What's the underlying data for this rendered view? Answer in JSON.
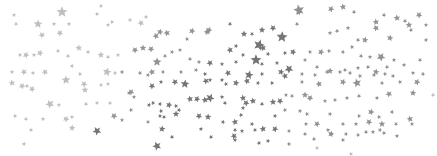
{
  "image": {
    "description": "Scattered gray star confetti on white background",
    "background": "#ffffff",
    "colors": {
      "dark": "#6e6e6e",
      "mid": "#8c8c8c",
      "light": "#b4b4b4"
    },
    "stars": [
      [
        62,
        12,
        5,
        "light"
      ],
      [
        101,
        6,
        2,
        "light"
      ],
      [
        14,
        15,
        2,
        "light"
      ],
      [
        16,
        24,
        2,
        "light"
      ],
      [
        38,
        24,
        4,
        "light"
      ],
      [
        42,
        35,
        3,
        "light"
      ],
      [
        54,
        24,
        2,
        "light"
      ],
      [
        60,
        33,
        3,
        "light"
      ],
      [
        69,
        24,
        2,
        "light"
      ],
      [
        97,
        14,
        2,
        "light"
      ],
      [
        108,
        25,
        2,
        "light"
      ],
      [
        112,
        22,
        2,
        "light"
      ],
      [
        130,
        20,
        2,
        "light"
      ],
      [
        141,
        23,
        3,
        "light"
      ],
      [
        146,
        17,
        2,
        "light"
      ],
      [
        156,
        36,
        3,
        "mid"
      ],
      [
        160,
        32,
        3,
        "mid"
      ],
      [
        167,
        33,
        3,
        "mid"
      ],
      [
        172,
        52,
        2,
        "mid"
      ],
      [
        187,
        39,
        2,
        "mid"
      ],
      [
        192,
        31,
        3,
        "mid"
      ],
      [
        207,
        32,
        3,
        "mid"
      ],
      [
        209,
        30,
        3,
        "mid"
      ],
      [
        20,
        55,
        2,
        "light"
      ],
      [
        26,
        55,
        3,
        "light"
      ],
      [
        34,
        55,
        2,
        "light"
      ],
      [
        40,
        53,
        3,
        "light"
      ],
      [
        58,
        51,
        2,
        "light"
      ],
      [
        68,
        56,
        2,
        "light"
      ],
      [
        79,
        48,
        3,
        "light"
      ],
      [
        88,
        52,
        2,
        "light"
      ],
      [
        101,
        55,
        3,
        "light"
      ],
      [
        108,
        57,
        2,
        "light"
      ],
      [
        118,
        55,
        2,
        "light"
      ],
      [
        135,
        50,
        3,
        "mid"
      ],
      [
        143,
        48,
        3,
        "mid"
      ],
      [
        151,
        49,
        3,
        "mid"
      ],
      [
        157,
        62,
        4,
        "mid"
      ],
      [
        165,
        56,
        2,
        "mid"
      ],
      [
        180,
        50,
        2,
        "mid"
      ],
      [
        190,
        59,
        2,
        "mid"
      ],
      [
        199,
        62,
        2,
        "mid"
      ],
      [
        210,
        63,
        3,
        "dark"
      ],
      [
        12,
        72,
        2,
        "light"
      ],
      [
        24,
        72,
        3,
        "light"
      ],
      [
        33,
        73,
        2,
        "light"
      ],
      [
        45,
        72,
        3,
        "light"
      ],
      [
        72,
        66,
        2,
        "light"
      ],
      [
        80,
        74,
        2,
        "light"
      ],
      [
        107,
        72,
        4,
        "light"
      ],
      [
        115,
        73,
        2,
        "light"
      ],
      [
        122,
        72,
        2,
        "mid"
      ],
      [
        140,
        73,
        2,
        "mid"
      ],
      [
        148,
        75,
        2,
        "mid"
      ],
      [
        152,
        72,
        3,
        "mid"
      ],
      [
        163,
        72,
        2,
        "mid"
      ],
      [
        181,
        72,
        2,
        "mid"
      ],
      [
        196,
        70,
        2,
        "mid"
      ],
      [
        205,
        74,
        2,
        "dark"
      ],
      [
        299,
        12,
        3,
        "mid"
      ],
      [
        299,
        10,
        5,
        "mid"
      ],
      [
        331,
        9,
        3,
        "mid"
      ],
      [
        343,
        7,
        3,
        "mid"
      ],
      [
        354,
        12,
        2,
        "mid"
      ],
      [
        376,
        22,
        3,
        "mid"
      ],
      [
        384,
        15,
        2,
        "mid"
      ],
      [
        397,
        18,
        3,
        "mid"
      ],
      [
        405,
        21,
        2,
        "mid"
      ],
      [
        409,
        25,
        3,
        "mid"
      ],
      [
        419,
        15,
        3,
        "mid"
      ],
      [
        426,
        25,
        2,
        "mid"
      ],
      [
        230,
        24,
        2,
        "dark"
      ],
      [
        244,
        34,
        3,
        "dark"
      ],
      [
        252,
        34,
        2,
        "dark"
      ],
      [
        262,
        30,
        3,
        "dark"
      ],
      [
        273,
        28,
        3,
        "dark"
      ],
      [
        282,
        37,
        5,
        "dark"
      ],
      [
        297,
        24,
        2,
        "mid"
      ],
      [
        330,
        33,
        2,
        "mid"
      ],
      [
        337,
        31,
        2,
        "mid"
      ],
      [
        348,
        28,
        2,
        "mid"
      ],
      [
        358,
        40,
        2,
        "mid"
      ],
      [
        365,
        40,
        3,
        "mid"
      ],
      [
        376,
        28,
        3,
        "mid"
      ],
      [
        390,
        38,
        3,
        "mid"
      ],
      [
        411,
        30,
        2,
        "mid"
      ],
      [
        426,
        40,
        2,
        "mid"
      ],
      [
        230,
        50,
        3,
        "dark"
      ],
      [
        236,
        46,
        2,
        "dark"
      ],
      [
        243,
        55,
        2,
        "dark"
      ],
      [
        259,
        45,
        5,
        "dark"
      ],
      [
        263,
        48,
        3,
        "dark"
      ],
      [
        268,
        54,
        2,
        "dark"
      ],
      [
        285,
        53,
        2,
        "dark"
      ],
      [
        293,
        52,
        3,
        "dark"
      ],
      [
        310,
        52,
        2,
        "mid"
      ],
      [
        321,
        52,
        3,
        "mid"
      ],
      [
        329,
        51,
        2,
        "mid"
      ],
      [
        343,
        52,
        2,
        "mid"
      ],
      [
        352,
        47,
        2,
        "mid"
      ],
      [
        361,
        56,
        2,
        "mid"
      ],
      [
        370,
        57,
        2,
        "mid"
      ],
      [
        381,
        57,
        4,
        "mid"
      ],
      [
        394,
        60,
        2,
        "mid"
      ],
      [
        420,
        60,
        2,
        "mid"
      ],
      [
        222,
        64,
        2,
        "dark"
      ],
      [
        236,
        62,
        2,
        "dark"
      ],
      [
        256,
        60,
        5,
        "dark"
      ],
      [
        262,
        64,
        2,
        "dark"
      ],
      [
        277,
        63,
        2,
        "dark"
      ],
      [
        289,
        69,
        4,
        "dark"
      ],
      [
        305,
        60,
        2,
        "mid"
      ],
      [
        317,
        67,
        2,
        "mid"
      ],
      [
        330,
        71,
        3,
        "mid"
      ],
      [
        345,
        70,
        2,
        "mid"
      ],
      [
        358,
        68,
        2,
        "mid"
      ],
      [
        368,
        67,
        2,
        "mid"
      ],
      [
        376,
        72,
        3,
        "mid"
      ],
      [
        387,
        67,
        2,
        "mid"
      ],
      [
        404,
        65,
        2,
        "mid"
      ],
      [
        228,
        73,
        3,
        "dark"
      ],
      [
        249,
        75,
        4,
        "dark"
      ],
      [
        262,
        74,
        2,
        "dark"
      ],
      [
        281,
        72,
        3,
        "dark"
      ],
      [
        285,
        76,
        3,
        "dark"
      ],
      [
        302,
        74,
        2,
        "mid"
      ],
      [
        315,
        75,
        2,
        "mid"
      ],
      [
        327,
        72,
        2,
        "mid"
      ],
      [
        340,
        72,
        2,
        "mid"
      ],
      [
        350,
        73,
        2,
        "mid"
      ],
      [
        360,
        76,
        2,
        "mid"
      ],
      [
        374,
        75,
        2,
        "mid"
      ],
      [
        385,
        74,
        2,
        "mid"
      ],
      [
        393,
        76,
        2,
        "mid"
      ],
      [
        413,
        73,
        2,
        "mid"
      ],
      [
        423,
        74,
        2,
        "mid"
      ],
      [
        12,
        83,
        3,
        "light"
      ],
      [
        22,
        86,
        3,
        "light"
      ],
      [
        27,
        86,
        2,
        "light"
      ],
      [
        32,
        89,
        3,
        "light"
      ],
      [
        66,
        80,
        4,
        "light"
      ],
      [
        84,
        84,
        3,
        "light"
      ],
      [
        85,
        90,
        3,
        "light"
      ],
      [
        101,
        85,
        2,
        "light"
      ],
      [
        108,
        84,
        2,
        "light"
      ],
      [
        131,
        92,
        3,
        "mid"
      ],
      [
        134,
        97,
        2,
        "mid"
      ],
      [
        152,
        86,
        3,
        "dark"
      ],
      [
        161,
        82,
        2,
        "dark"
      ],
      [
        175,
        82,
        3,
        "dark"
      ],
      [
        185,
        84,
        4,
        "dark"
      ],
      [
        206,
        81,
        3,
        "dark"
      ],
      [
        210,
        80,
        2,
        "dark"
      ],
      [
        50,
        104,
        4,
        "light"
      ],
      [
        59,
        105,
        2,
        "light"
      ],
      [
        86,
        104,
        2,
        "light"
      ],
      [
        97,
        103,
        2,
        "light"
      ],
      [
        110,
        103,
        2,
        "light"
      ],
      [
        129,
        93,
        2,
        "mid"
      ],
      [
        131,
        110,
        2,
        "mid"
      ],
      [
        149,
        105,
        2,
        "dark"
      ],
      [
        153,
        103,
        2,
        "dark"
      ],
      [
        160,
        104,
        2,
        "dark"
      ],
      [
        161,
        111,
        2,
        "dark"
      ],
      [
        169,
        105,
        3,
        "dark"
      ],
      [
        176,
        106,
        2,
        "dark"
      ],
      [
        179,
        110,
        2,
        "dark"
      ],
      [
        190,
        99,
        3,
        "dark"
      ],
      [
        197,
        99,
        3,
        "dark"
      ],
      [
        205,
        100,
        3,
        "dark"
      ],
      [
        210,
        98,
        4,
        "dark"
      ],
      [
        15,
        116,
        2,
        "light"
      ],
      [
        26,
        119,
        2,
        "light"
      ],
      [
        43,
        119,
        2,
        "light"
      ],
      [
        66,
        119,
        3,
        "light"
      ],
      [
        72,
        117,
        2,
        "light"
      ],
      [
        114,
        116,
        3,
        "mid"
      ],
      [
        122,
        120,
        2,
        "mid"
      ],
      [
        148,
        122,
        2,
        "mid"
      ],
      [
        160,
        116,
        2,
        "dark"
      ],
      [
        164,
        117,
        2,
        "dark"
      ],
      [
        176,
        114,
        3,
        "dark"
      ],
      [
        199,
        116,
        3,
        "dark"
      ],
      [
        208,
        117,
        3,
        "dark"
      ],
      [
        31,
        130,
        2,
        "light"
      ],
      [
        72,
        128,
        3,
        "light"
      ],
      [
        97,
        131,
        4,
        "dark"
      ],
      [
        162,
        129,
        3,
        "dark"
      ],
      [
        172,
        137,
        2,
        "dark"
      ],
      [
        201,
        129,
        2,
        "dark"
      ],
      [
        211,
        137,
        2,
        "dark"
      ],
      [
        24,
        144,
        2,
        "light"
      ],
      [
        157,
        146,
        4,
        "dark"
      ],
      [
        222,
        80,
        2,
        "dark"
      ],
      [
        226,
        84,
        2,
        "dark"
      ],
      [
        236,
        83,
        3,
        "dark"
      ],
      [
        247,
        81,
        3,
        "dark"
      ],
      [
        258,
        83,
        2,
        "dark"
      ],
      [
        272,
        83,
        2,
        "dark"
      ],
      [
        302,
        82,
        2,
        "mid"
      ],
      [
        319,
        84,
        3,
        "mid"
      ],
      [
        343,
        82,
        3,
        "mid"
      ],
      [
        357,
        83,
        4,
        "mid"
      ],
      [
        382,
        83,
        2,
        "mid"
      ],
      [
        400,
        82,
        2,
        "mid"
      ],
      [
        417,
        82,
        3,
        "mid"
      ],
      [
        222,
        97,
        2,
        "dark"
      ],
      [
        225,
        103,
        2,
        "dark"
      ],
      [
        243,
        98,
        3,
        "dark"
      ],
      [
        246,
        103,
        3,
        "dark"
      ],
      [
        253,
        101,
        3,
        "dark"
      ],
      [
        262,
        104,
        2,
        "dark"
      ],
      [
        273,
        102,
        3,
        "dark"
      ],
      [
        280,
        101,
        3,
        "dark"
      ],
      [
        286,
        95,
        2,
        "mid"
      ],
      [
        292,
        96,
        2,
        "mid"
      ],
      [
        305,
        95,
        3,
        "mid"
      ],
      [
        310,
        98,
        3,
        "mid"
      ],
      [
        325,
        101,
        2,
        "mid"
      ],
      [
        335,
        100,
        2,
        "mid"
      ],
      [
        347,
        98,
        2,
        "mid"
      ],
      [
        359,
        96,
        2,
        "mid"
      ],
      [
        377,
        98,
        2,
        "mid"
      ],
      [
        389,
        94,
        3,
        "mid"
      ],
      [
        413,
        93,
        3,
        "mid"
      ],
      [
        433,
        95,
        2,
        "light"
      ],
      [
        243,
        108,
        2,
        "dark"
      ],
      [
        241,
        115,
        2,
        "dark"
      ],
      [
        275,
        116,
        2,
        "dark"
      ],
      [
        285,
        110,
        2,
        "mid"
      ],
      [
        300,
        111,
        2,
        "mid"
      ],
      [
        307,
        114,
        2,
        "mid"
      ],
      [
        330,
        114,
        2,
        "mid"
      ],
      [
        359,
        116,
        2,
        "mid"
      ],
      [
        371,
        112,
        3,
        "mid"
      ],
      [
        379,
        117,
        2,
        "mid"
      ],
      [
        392,
        112,
        2,
        "mid"
      ],
      [
        410,
        119,
        3,
        "mid"
      ],
      [
        223,
        122,
        2,
        "dark"
      ],
      [
        235,
        122,
        3,
        "dark"
      ],
      [
        252,
        124,
        2,
        "dark"
      ],
      [
        263,
        129,
        3,
        "dark"
      ],
      [
        275,
        129,
        3,
        "dark"
      ],
      [
        306,
        124,
        2,
        "mid"
      ],
      [
        317,
        124,
        3,
        "mid"
      ],
      [
        328,
        130,
        2,
        "mid"
      ],
      [
        343,
        124,
        2,
        "mid"
      ],
      [
        356,
        124,
        2,
        "mid"
      ],
      [
        369,
        122,
        3,
        "mid"
      ],
      [
        382,
        124,
        3,
        "mid"
      ],
      [
        396,
        124,
        2,
        "mid"
      ],
      [
        412,
        124,
        2,
        "mid"
      ],
      [
        235,
        130,
        2,
        "dark"
      ],
      [
        242,
        131,
        2,
        "dark"
      ],
      [
        255,
        130,
        2,
        "dark"
      ],
      [
        289,
        131,
        2,
        "mid"
      ],
      [
        305,
        134,
        2,
        "mid"
      ],
      [
        331,
        134,
        2,
        "mid"
      ],
      [
        366,
        132,
        2,
        "mid"
      ],
      [
        373,
        132,
        2,
        "mid"
      ],
      [
        384,
        133,
        2,
        "mid"
      ],
      [
        397,
        136,
        2,
        "mid"
      ],
      [
        234,
        136,
        3,
        "dark"
      ],
      [
        235,
        140,
        2,
        "dark"
      ],
      [
        259,
        143,
        2,
        "dark"
      ],
      [
        268,
        141,
        2,
        "dark"
      ],
      [
        314,
        139,
        2,
        "mid"
      ],
      [
        331,
        134,
        3,
        "mid"
      ],
      [
        343,
        140,
        2,
        "mid"
      ],
      [
        346,
        134,
        2,
        "mid"
      ],
      [
        358,
        135,
        2,
        "mid"
      ],
      [
        380,
        130,
        2,
        "mid"
      ],
      [
        289,
        144,
        2,
        "mid"
      ],
      [
        317,
        148,
        2,
        "light"
      ],
      [
        351,
        154,
        2,
        "light"
      ]
    ]
  }
}
